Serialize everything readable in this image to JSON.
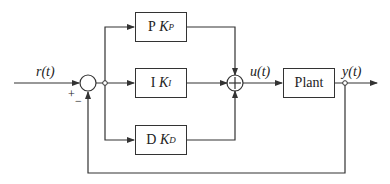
{
  "diagram": {
    "type": "block-diagram",
    "signals": {
      "reference": "r(t)",
      "control": "u(t)",
      "output": "y(t)"
    },
    "summing_junction": {
      "plus_sign": "+",
      "minus_sign": "−"
    },
    "blocks": [
      {
        "id": "p",
        "prefix": "P",
        "gain": "K",
        "subscript": "P"
      },
      {
        "id": "i",
        "prefix": "I",
        "gain": "K",
        "subscript": "I"
      },
      {
        "id": "d",
        "prefix": "D",
        "gain": "K",
        "subscript": "D"
      },
      {
        "id": "plant",
        "label": "Plant"
      }
    ],
    "adder_symbol": "+",
    "colors": {
      "line": "#333333",
      "background": "#ffffff",
      "text": "#222222"
    }
  }
}
